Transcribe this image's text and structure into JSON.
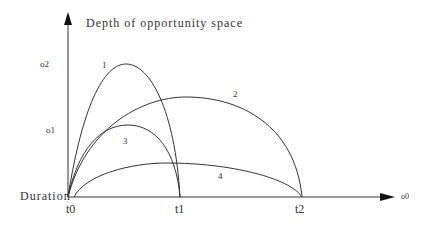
{
  "diagram": {
    "y_axis_label": "Depth of opportunity space",
    "x_axis_origin_label": "Duration",
    "x_axis_end_label": "o0",
    "y_ticks": [
      {
        "label": "o2"
      },
      {
        "label": "o1"
      }
    ],
    "x_ticks": [
      {
        "label": "t0"
      },
      {
        "label": "t1"
      },
      {
        "label": "t2"
      }
    ],
    "curves": [
      {
        "label": "1",
        "start": "t0",
        "end": "t1",
        "peak": "o2"
      },
      {
        "label": "2",
        "start": "t0",
        "end": "t2",
        "peak": "between o2 and o1"
      },
      {
        "label": "3",
        "start": "t0",
        "end": "t1",
        "peak": "o1"
      },
      {
        "label": "4",
        "start": "t0",
        "end": "t2",
        "peak": "low"
      }
    ],
    "stroke_color": "#333333"
  }
}
